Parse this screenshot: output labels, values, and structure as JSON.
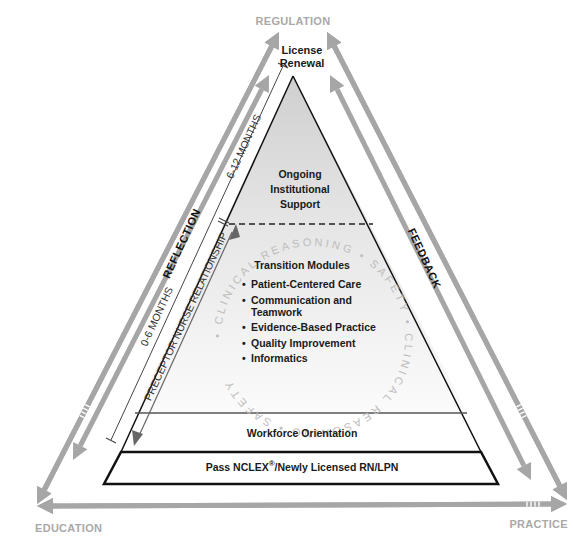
{
  "corners": {
    "top": "REGULATION",
    "bottom_left": "EDUCATION",
    "bottom_right": "PRACTICE"
  },
  "apex_label": [
    "License",
    "Renewal"
  ],
  "side_labels": {
    "left": "REFLECTION",
    "right": "FEEDBACK"
  },
  "timeline": {
    "upper": "6-12 MONTHS",
    "lower": "0-6 MONTHS",
    "relationship": "PRECEPTOR NURSE RELATIONSHIP"
  },
  "tiers": {
    "top": [
      "Ongoing",
      "Institutional",
      "Support"
    ],
    "middle_title": "Transition Modules",
    "modules": [
      "Patient-Centered Care",
      "Communication and",
      "Teamwork",
      "Evidence-Based Practice",
      "Quality Improvement",
      "Informatics"
    ],
    "orientation": "Workforce Orientation",
    "base_prefix": "Pass NCLEX",
    "base_reg": "®",
    "base_suffix": "/Newly Licensed RN/LPN"
  },
  "circular_text": "• CLINICAL REASONING • SAFETY • CLINICAL REASONING • SAFETY",
  "colors": {
    "arrow": "#a6a6a6",
    "upper_fill": "#d4d4d4",
    "line": "#111111"
  }
}
